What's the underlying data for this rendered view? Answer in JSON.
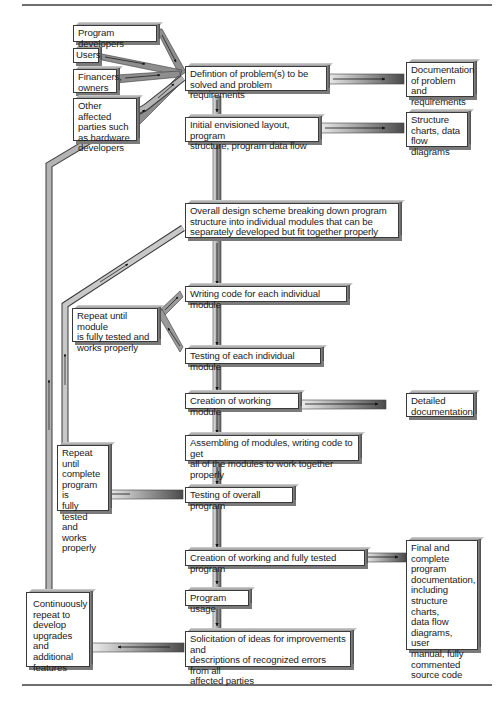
{
  "diagram": {
    "type": "flowchart",
    "title": "",
    "stakeholders": [
      {
        "id": "program-developers",
        "label": "Program developers"
      },
      {
        "id": "users",
        "label": "Users"
      },
      {
        "id": "financers-owners",
        "label": "Financers,\nowners"
      },
      {
        "id": "other-affected-parties",
        "label": "Other affected\nparties such\nas hardware\ndevelopers"
      }
    ],
    "main_steps": [
      {
        "id": "definition",
        "label": "Defintion of problem(s) to be\nsolved and problem requirements"
      },
      {
        "id": "initial-layout",
        "label": "Initial envisioned layout, program\nstructure, program data flow"
      },
      {
        "id": "overall-design",
        "label": "Overall design scheme breaking down program\nstructure into individual modules that can be\nseparately developed but fit together properly"
      },
      {
        "id": "writing-code",
        "label": "Writing code for each individual module"
      },
      {
        "id": "testing-module",
        "label": "Testing of each individual module"
      },
      {
        "id": "creation-module",
        "label": "Creation of working module"
      },
      {
        "id": "assembling",
        "label": "Assembling of modules, writing code to get\nall of the modules to work together properly"
      },
      {
        "id": "testing-overall",
        "label": "Testing of overall program"
      },
      {
        "id": "creation-program",
        "label": "Creation of working and fully tested program"
      },
      {
        "id": "program-usage",
        "label": "Program usage"
      },
      {
        "id": "solicitation",
        "label": "Solicitation of ideas for improvements and\ndescriptions of recognized errors from all\naffected parties"
      }
    ],
    "outputs": [
      {
        "id": "doc-problem",
        "label": "Documentation\nof problem and\nrequirements"
      },
      {
        "id": "structure-charts",
        "label": "Structure\ncharts, data\nflow diagrams"
      },
      {
        "id": "detailed-doc",
        "label": "Detailed\ndocumentation"
      },
      {
        "id": "final-doc",
        "label": "Final and\ncomplete\nprogram\ndocumentation,\nincluding\nstructure charts,\ndata flow\ndiagrams, user\nmanual, fully\ncommented\nsource code"
      }
    ],
    "loops": [
      {
        "id": "repeat-module",
        "label": "Repeat until module\nis fully tested and\nworks properly"
      },
      {
        "id": "repeat-program",
        "label": "Repeat until\ncomplete\nprogram is\nfully tested\nand works\nproperly"
      },
      {
        "id": "continuous",
        "label": "Continuously\nrepeat to\ndevelop\nupgrades and\nadditional\nfeatures"
      }
    ],
    "edges": [
      [
        "program-developers",
        "definition"
      ],
      [
        "users",
        "definition"
      ],
      [
        "financers-owners",
        "definition"
      ],
      [
        "other-affected-parties",
        "definition"
      ],
      [
        "definition",
        "doc-problem"
      ],
      [
        "definition",
        "initial-layout"
      ],
      [
        "initial-layout",
        "structure-charts"
      ],
      [
        "initial-layout",
        "overall-design"
      ],
      [
        "overall-design",
        "writing-code"
      ],
      [
        "writing-code",
        "testing-module"
      ],
      [
        "testing-module",
        "repeat-module"
      ],
      [
        "repeat-module",
        "writing-code"
      ],
      [
        "testing-module",
        "creation-module"
      ],
      [
        "creation-module",
        "detailed-doc"
      ],
      [
        "creation-module",
        "assembling"
      ],
      [
        "assembling",
        "testing-overall"
      ],
      [
        "testing-overall",
        "repeat-program"
      ],
      [
        "repeat-program",
        "overall-design"
      ],
      [
        "testing-overall",
        "creation-program"
      ],
      [
        "creation-program",
        "final-doc"
      ],
      [
        "creation-program",
        "program-usage"
      ],
      [
        "program-usage",
        "solicitation"
      ],
      [
        "solicitation",
        "continuous"
      ],
      [
        "continuous",
        "definition"
      ]
    ]
  }
}
